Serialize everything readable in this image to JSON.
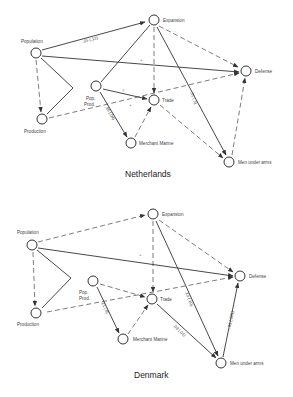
{
  "diagrams": [
    {
      "title": "Netherlands",
      "nodes": {
        "population": "Population",
        "expansion": "Expansion",
        "defense": "Defense",
        "pop_prod_1": "Pop.",
        "pop_prod_2": "Prod.",
        "trade": "Trade",
        "production": "Production",
        "merchant_marine": "Merchant Marine",
        "men_under_arms": "Men under arms"
      },
      "edge_labels": {
        "population_expansion": ".35 (.13)",
        "population_defense": "+",
        "popprod_trade": "+",
        "production_defense": "+",
        "popprod_merchant": ".98 (.04)",
        "expansion_menunderarms": ".31 (.3)"
      }
    },
    {
      "title": "Denmark",
      "nodes": {
        "population": "Population",
        "expansion": "Expansion",
        "defense": "Defense",
        "pop_prod_1": "Pop.",
        "pop_prod_2": "Prod.",
        "trade": "Trade",
        "production": "Production",
        "merchant_marine": "Merchant Marine",
        "men_under_arms": "Men under arms"
      },
      "edge_labels": {
        "population_defense": "+",
        "popprod_merchant": ".21 (.8)",
        "expansion_menunderarms": ".23 (.10)",
        "trade_menunderarms": ".03 (.01)",
        "menunderarms_defense": "-.01 (.001)"
      }
    }
  ]
}
